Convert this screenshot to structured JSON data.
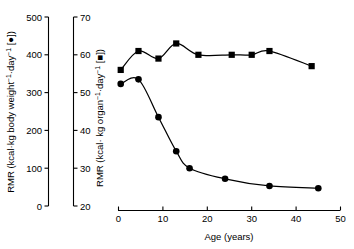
{
  "figure": {
    "background": "#ffffff",
    "ink": "#000000"
  },
  "axes": {
    "x": {
      "title": "Age (years)",
      "ticks": [
        "0",
        "10",
        "20",
        "30",
        "40",
        "50"
      ],
      "min": 0,
      "max": 50
    },
    "y_left": {
      "title_main": "RMR (kcal·kg body weight",
      "title_sup1": "−1",
      "title_mid": "·day",
      "title_sup2": "−1",
      "title_end": " [●])",
      "title_plain": "RMR (kcal·kg body weight−1·day−1 [●])",
      "ticks": [
        "0",
        "100",
        "200",
        "300",
        "400",
        "500"
      ],
      "min": 0,
      "max": 500,
      "marker": "circle"
    },
    "y_right": {
      "title_main": "RMR (kcal· kg organ",
      "title_sup1": "−1",
      "title_mid": "·day",
      "title_sup2": "−1",
      "title_end": " [■])",
      "title_plain": "RMR (kcal· kg organ−1·day−1 [■])",
      "ticks": [
        "20",
        "30",
        "40",
        "50",
        "60",
        "70"
      ],
      "min": 20,
      "max": 70,
      "marker": "square"
    }
  },
  "chart_data": {
    "type": "scatter",
    "title": "",
    "xlabel": "Age (years)",
    "grid": false,
    "legend": "inline-in-axis-titles",
    "xlim": [
      0,
      50
    ],
    "series": [
      {
        "name": "RMR per kg body weight",
        "marker": "circle",
        "axis": "left",
        "ylabel": "RMR (kcal·kg body weight−1·day−1 [●])",
        "ylim": [
          0,
          500
        ],
        "x": [
          0.5,
          4.5,
          9.0,
          13.0,
          16.0,
          24.0,
          34.0,
          45.0
        ],
        "y": [
          323,
          335,
          235,
          145,
          100,
          72,
          53,
          47
        ]
      },
      {
        "name": "RMR per kg organ",
        "marker": "square",
        "axis": "right",
        "ylabel": "RMR (kcal· kg organ−1·day−1 [■])",
        "ylim": [
          20,
          70
        ],
        "x": [
          0.5,
          4.5,
          9.0,
          13.0,
          18.0,
          25.5,
          30.0,
          34.0,
          43.5
        ],
        "y": [
          56.0,
          61.0,
          59.0,
          63.0,
          60.0,
          60.0,
          60.0,
          61.0,
          57.0
        ]
      }
    ]
  }
}
